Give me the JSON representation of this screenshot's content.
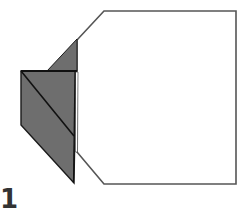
{
  "diagram": {
    "type": "origami-fold-step",
    "step_number": "1",
    "colors": {
      "paper_front": "#ffffff",
      "paper_back": "#6e6e6e",
      "outline": "#555555",
      "crease": "#1a1a1a",
      "background": "#ffffff"
    },
    "shapes": {
      "white_paper_outline": "104,11 236,11 236,184 104,184 77,152 77,40",
      "gray_upper_triangle": "77,39 47,71 77,71",
      "gray_flap": "21,71 75,71 73,183 21,125",
      "inner_fold_line": "21,71 73,135",
      "flap_top_edge": "21,71 77,71",
      "white_slit": "76,72 78,72 77,152 75,152"
    }
  }
}
